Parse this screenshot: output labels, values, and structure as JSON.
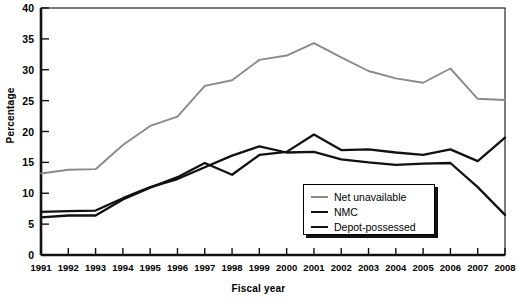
{
  "chart_data": {
    "type": "line",
    "title": "",
    "xlabel": "Fiscal year",
    "ylabel": "Percentage",
    "grid": false,
    "legend_position": "bottom-right",
    "x": [
      1991,
      1992,
      1993,
      1994,
      1995,
      1996,
      1997,
      1998,
      1999,
      2000,
      2001,
      2002,
      2003,
      2004,
      2005,
      2006,
      2007,
      2008
    ],
    "categories": [
      "1991",
      "1992",
      "1993",
      "1994",
      "1995",
      "1996",
      "1997",
      "1998",
      "1999",
      "2000",
      "2001",
      "2002",
      "2003",
      "2004",
      "2005",
      "2006",
      "2007",
      "2008"
    ],
    "xlim": [
      1991,
      2008
    ],
    "ylim": [
      0,
      40
    ],
    "yticks": [
      0,
      5,
      10,
      15,
      20,
      25,
      30,
      35,
      40
    ],
    "series": [
      {
        "name": "Net unavailable",
        "color": "#8a8a8a",
        "values": [
          13.2,
          13.8,
          13.9,
          17.8,
          20.9,
          22.4,
          27.4,
          28.3,
          31.6,
          32.3,
          34.3,
          32.0,
          29.8,
          28.6,
          27.9,
          30.2,
          25.3,
          25.1
        ]
      },
      {
        "name": "NMC",
        "color": "#111111",
        "values": [
          6.1,
          6.4,
          6.4,
          9.0,
          10.9,
          12.6,
          14.9,
          13.0,
          16.2,
          16.7,
          19.5,
          17.0,
          17.1,
          16.6,
          16.2,
          17.1,
          15.2,
          19.0
        ]
      },
      {
        "name": "Depot-possessed",
        "color": "#111111",
        "values": [
          7.0,
          7.1,
          7.2,
          9.2,
          11.0,
          12.3,
          14.2,
          16.1,
          17.6,
          16.6,
          16.7,
          15.5,
          15.0,
          14.6,
          14.8,
          14.9,
          11.0,
          6.5
        ]
      }
    ]
  },
  "legend": {
    "items": [
      {
        "label": "Net unavailable",
        "color": "#8a8a8a"
      },
      {
        "label": "NMC",
        "color": "#111111"
      },
      {
        "label": "Depot-possessed",
        "color": "#111111"
      }
    ]
  },
  "axes": {
    "frame_color": "#111111"
  }
}
